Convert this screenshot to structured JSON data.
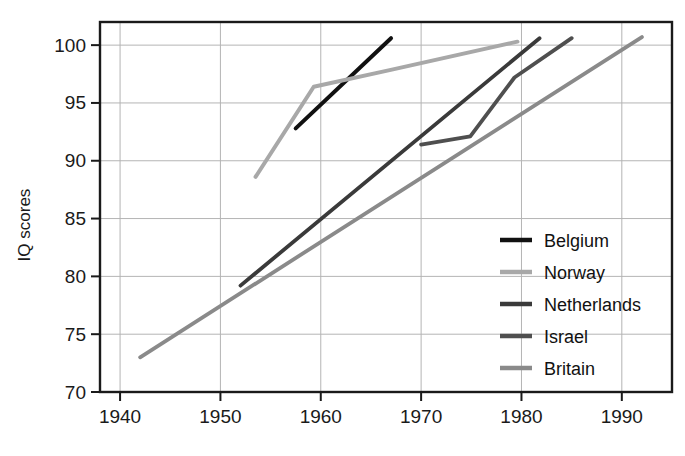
{
  "chart_data": {
    "type": "line",
    "title": "",
    "subtitle": "",
    "xlabel": "",
    "ylabel": "IQ scores",
    "xlim": [
      1938,
      1995
    ],
    "ylim": [
      70,
      102
    ],
    "xticks": [
      1940,
      1950,
      1960,
      1970,
      1980,
      1990
    ],
    "xtick_labels": [
      "1940",
      "1950",
      "1960",
      "1970",
      "1980",
      "1990"
    ],
    "yticks": [
      70,
      75,
      80,
      85,
      90,
      95,
      100
    ],
    "ytick_labels": [
      "70",
      "75",
      "80",
      "85",
      "90",
      "95",
      "100"
    ],
    "grid": "both",
    "legend_position": "inside-right-lower",
    "series": [
      {
        "name": "Belgium",
        "color": "#111111",
        "width": 4.0,
        "x": [
          1957.5,
          1967.0
        ],
        "y": [
          92.8,
          100.6
        ]
      },
      {
        "name": "Norway",
        "color": "#a8a8a8",
        "width": 4.0,
        "x": [
          1953.5,
          1959.3,
          1967.2,
          1979.6
        ],
        "y": [
          88.6,
          96.4,
          97.9,
          100.3
        ]
      },
      {
        "name": "Netherlands",
        "color": "#3a3a3a",
        "width": 3.8,
        "x": [
          1952.0,
          1981.8
        ],
        "y": [
          79.2,
          100.6
        ]
      },
      {
        "name": "Israel",
        "color": "#4f4f4f",
        "width": 3.8,
        "x": [
          1970.0,
          1974.9,
          1979.3,
          1985.0
        ],
        "y": [
          91.4,
          92.1,
          97.2,
          100.6
        ]
      },
      {
        "name": "Britain",
        "color": "#8a8a8a",
        "width": 3.8,
        "x": [
          1942.0,
          1992.0
        ],
        "y": [
          73.0,
          100.7
        ]
      }
    ]
  },
  "legend": {
    "entries": [
      {
        "label": "Belgium",
        "color": "#111111"
      },
      {
        "label": "Norway",
        "color": "#a8a8a8"
      },
      {
        "label": "Netherlands",
        "color": "#3a3a3a"
      },
      {
        "label": "Israel",
        "color": "#4f4f4f"
      },
      {
        "label": "Britain",
        "color": "#8a8a8a"
      }
    ]
  }
}
